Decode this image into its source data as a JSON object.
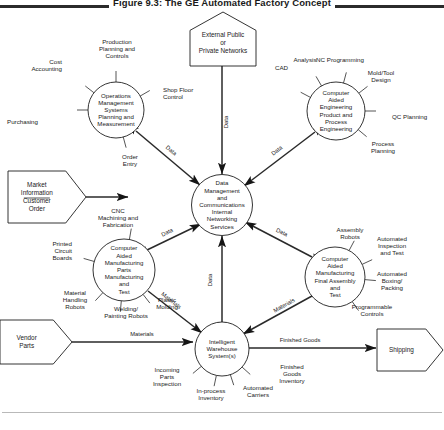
{
  "figure": {
    "title": "Figure 9.3:  The GE Automated Factory Concept",
    "caption": ""
  },
  "diagram": {
    "type": "data-flow-diagram",
    "hub": {
      "id": "hub",
      "shape": "circle",
      "cx": 222,
      "cy": 205,
      "r": 30.5,
      "label": "Data Management and Communications Internal Networking Services",
      "lines": [
        "Data",
        "Management",
        "and",
        "Communications",
        "Internal",
        "Networking",
        "Services"
      ]
    },
    "processes": [
      {
        "id": "operations",
        "shape": "circle",
        "cx": 116,
        "cy": 110,
        "r": 28,
        "lines": [
          "Operations",
          "Management",
          "Systems",
          "Planning and",
          "Measurement"
        ],
        "spokes": [
          {
            "name": "cost-accounting",
            "lines": [
              "Cost",
              "Accounting"
            ],
            "angle": 218,
            "tx": 62,
            "ty": 64,
            "anchor": "end"
          },
          {
            "name": "production-planning-and-controls",
            "lines": [
              "Production",
              "Planning and",
              "Controls"
            ],
            "angle": 270,
            "tx": 117,
            "ty": 44,
            "anchor": "middle"
          },
          {
            "name": "purchasing",
            "lines": [
              "Purchasing"
            ],
            "angle": 180,
            "tx": 38,
            "ty": 124,
            "anchor": "end"
          },
          {
            "name": "shop-floor-control",
            "lines": [
              "Shop Floor",
              "Control"
            ],
            "angle": 330,
            "tx": 163,
            "ty": 92,
            "anchor": "start"
          },
          {
            "name": "order-entry",
            "lines": [
              "Order",
              "Entry"
            ],
            "angle": 75,
            "tx": 130,
            "ty": 165,
            "anchor": "middle"
          }
        ]
      },
      {
        "id": "engineering",
        "shape": "circle",
        "cx": 336,
        "cy": 111,
        "r": 29,
        "lines": [
          "Computer",
          "Aided",
          "Engineering",
          "Product and",
          "Process",
          "Engineering"
        ],
        "spokes": [
          {
            "name": "cad",
            "lines": [
              "CAD"
            ],
            "angle": 208,
            "tx": 288,
            "ty": 70,
            "anchor": "end"
          },
          {
            "name": "analysis",
            "lines": [
              "Analysis"
            ],
            "angle": 240,
            "tx": 305,
            "ty": 62,
            "anchor": "middle"
          },
          {
            "name": "nc-programming",
            "lines": [
              "NC Programming"
            ],
            "angle": 285,
            "tx": 340,
            "ty": 62,
            "anchor": "middle"
          },
          {
            "name": "mold-tool-design",
            "lines": [
              "Mold/Tool",
              "Design"
            ],
            "angle": 322,
            "tx": 381,
            "ty": 75,
            "anchor": "middle"
          },
          {
            "name": "qc-planning",
            "lines": [
              "QC Planning"
            ],
            "angle": 0,
            "tx": 392,
            "ty": 119,
            "anchor": "start"
          },
          {
            "name": "process-planning",
            "lines": [
              "Process",
              "Planning"
            ],
            "angle": 40,
            "tx": 383,
            "ty": 152,
            "anchor": "middle"
          }
        ]
      },
      {
        "id": "cam-parts",
        "shape": "circle",
        "cx": 124,
        "cy": 270,
        "r": 31,
        "lines": [
          "Computer",
          "Aided",
          "Manufacturing",
          "Parts",
          "Manufacturing",
          "and",
          "Test"
        ],
        "spokes": [
          {
            "name": "cnc-machining-and-fabrication",
            "lines": [
              "CNC",
              "Machining and",
              "Fabrication"
            ],
            "angle": 280,
            "tx": 118,
            "ty": 213,
            "anchor": "middle"
          },
          {
            "name": "printed-circuit-boards",
            "lines": [
              "Printed",
              "Circuit",
              "Boards"
            ],
            "angle": 196,
            "tx": 72,
            "ty": 246,
            "anchor": "end"
          },
          {
            "name": "material-handling-robots",
            "lines": [
              "Material",
              "Handling",
              "Robots"
            ],
            "angle": 133,
            "tx": 75,
            "ty": 308,
            "anchor": "middle"
          },
          {
            "name": "welding-painting-robots",
            "lines": [
              "Welding/",
              "Painting Robots"
            ],
            "angle": 95,
            "tx": 126,
            "ty": 317,
            "anchor": "middle"
          },
          {
            "name": "plastic-molding",
            "lines": [
              "Plastic",
              "Molding"
            ],
            "angle": 52,
            "tx": 167,
            "ty": 308,
            "anchor": "middle"
          }
        ]
      },
      {
        "id": "cam-final-assembly",
        "shape": "circle",
        "cx": 335,
        "cy": 277,
        "r": 30,
        "lines": [
          "Computer",
          "Aided",
          "Manufacturing",
          "Final  Assembly",
          "and",
          "Test"
        ],
        "spokes": [
          {
            "name": "assembly-robots",
            "lines": [
              "Assembly",
              "Robots"
            ],
            "angle": 298,
            "tx": 350,
            "ty": 232,
            "anchor": "middle"
          },
          {
            "name": "automated-inspection-and-test",
            "lines": [
              "Automated",
              "Inspection",
              "and Test"
            ],
            "angle": 335,
            "tx": 392,
            "ty": 241,
            "anchor": "middle"
          },
          {
            "name": "automated-boxing-packing",
            "lines": [
              "Automated",
              "Boxing/",
              "Packing"
            ],
            "angle": 5,
            "tx": 392,
            "ty": 276,
            "anchor": "middle"
          },
          {
            "name": "programmable-controls",
            "lines": [
              "Programmable",
              "Controls"
            ],
            "angle": 55,
            "tx": 372,
            "ty": 315,
            "anchor": "middle"
          }
        ]
      },
      {
        "id": "warehouse",
        "shape": "circle",
        "cx": 222,
        "cy": 349,
        "r": 27,
        "lines": [
          "Intelligent",
          "Warehouse",
          "System(s)"
        ],
        "spokes": [
          {
            "name": "incoming-parts-inspection",
            "lines": [
              "Incoming",
              "Parts",
              "Inspection"
            ],
            "angle": 140,
            "tx": 167,
            "ty": 385,
            "anchor": "middle"
          },
          {
            "name": "in-process-inventory",
            "lines": [
              "In-process",
              "Inventory"
            ],
            "angle": 102,
            "tx": 211,
            "ty": 399,
            "anchor": "middle"
          },
          {
            "name": "automated-carriers",
            "lines": [
              "Automated",
              "Carriers"
            ],
            "angle": 72,
            "tx": 258,
            "ty": 396,
            "anchor": "middle"
          },
          {
            "name": "finished-goods-inventory",
            "lines": [
              "Finished",
              "Goods",
              "Inventory"
            ],
            "angle": 42,
            "tx": 292,
            "ty": 382,
            "anchor": "middle"
          }
        ]
      }
    ],
    "external_entities": [
      {
        "id": "external-networks",
        "shape": "house",
        "x": 190,
        "y": 12,
        "w": 66,
        "h": 54,
        "lines": [
          "External Public",
          "or",
          "Private Networks"
        ]
      },
      {
        "id": "market-information",
        "shape": "arrow-right",
        "x": 8,
        "y": 171,
        "w": 78,
        "h": 52,
        "lines": [
          "Market",
          "Information",
          "Customer",
          "Order"
        ],
        "divider": true
      },
      {
        "id": "vendor-parts",
        "shape": "arrow-right",
        "x": 0,
        "y": 320,
        "w": 72,
        "h": 44,
        "lines": [
          "Vendor",
          "Parts"
        ]
      },
      {
        "id": "shipping",
        "shape": "arrow-right",
        "x": 377,
        "y": 329,
        "w": 66,
        "h": 42,
        "lines": [
          "Shipping"
        ]
      }
    ],
    "flows": [
      {
        "id": "flow-networks-hub",
        "label": "Data",
        "from": "external-networks",
        "to": "hub",
        "x1": 222,
        "y1": 66,
        "x2": 222,
        "y2": 174,
        "arrows": "both",
        "lx": 228,
        "ly": 122,
        "rotate": -90
      },
      {
        "id": "flow-operations-hub",
        "label": "Data",
        "from": "operations",
        "to": "hub",
        "x1": 136,
        "y1": 131,
        "x2": 200,
        "y2": 185,
        "arrows": "both",
        "lx": 170,
        "ly": 152,
        "rotate": 40
      },
      {
        "id": "flow-engineering-hub",
        "label": "Data",
        "from": "engineering",
        "to": "hub",
        "x1": 315,
        "y1": 132,
        "x2": 244,
        "y2": 186,
        "arrows": "both",
        "lx": 278,
        "ly": 152,
        "rotate": -38
      },
      {
        "id": "flow-camparts-hub",
        "label": "Data",
        "from": "cam-parts",
        "to": "hub",
        "x1": 147,
        "y1": 250,
        "x2": 201,
        "y2": 224,
        "arrows": "both",
        "lx": 168,
        "ly": 234,
        "rotate": -26
      },
      {
        "id": "flow-camfinal-hub",
        "label": "Data",
        "from": "cam-final-assembly",
        "to": "hub",
        "x1": 312,
        "y1": 257,
        "x2": 245,
        "y2": 222,
        "arrows": "both",
        "lx": 281,
        "ly": 234,
        "rotate": 27
      },
      {
        "id": "flow-warehouse-hub",
        "label": "Data",
        "from": "warehouse",
        "to": "hub",
        "x1": 222,
        "y1": 322,
        "x2": 222,
        "y2": 236,
        "arrows": "both",
        "lx": 212,
        "ly": 280,
        "rotate": -90
      },
      {
        "id": "flow-market-operations",
        "label": "",
        "from": "market-information",
        "to": "operations",
        "x1": 86,
        "y1": 197,
        "x2": 128,
        "y2": 197,
        "arrows": "end",
        "lx": 0,
        "ly": 0,
        "rotate": 0
      },
      {
        "id": "flow-camparts-warehouse",
        "label": "Materials",
        "from": "cam-parts",
        "to": "warehouse",
        "x1": 148,
        "y1": 291,
        "x2": 202,
        "y2": 333,
        "arrows": "end",
        "lx": 170,
        "ly": 302,
        "rotate": 38
      },
      {
        "id": "flow-camfinal-warehouse",
        "label": "Materials",
        "from": "cam-final-assembly",
        "to": "warehouse",
        "x1": 312,
        "y1": 296,
        "x2": 243,
        "y2": 334,
        "arrows": "end",
        "lx": 285,
        "ly": 307,
        "rotate": -29
      },
      {
        "id": "flow-vendor-warehouse",
        "label": "Materials",
        "from": "vendor-parts",
        "to": "warehouse",
        "x1": 72,
        "y1": 342,
        "x2": 193,
        "y2": 342,
        "arrows": "end",
        "lx": 142,
        "ly": 336,
        "rotate": 0
      },
      {
        "id": "flow-warehouse-shipping",
        "label": "Finished Goods",
        "from": "warehouse",
        "to": "shipping",
        "x1": 249,
        "y1": 348,
        "x2": 376,
        "y2": 348,
        "arrows": "end",
        "lx": 300,
        "ly": 342,
        "rotate": 0
      }
    ]
  }
}
